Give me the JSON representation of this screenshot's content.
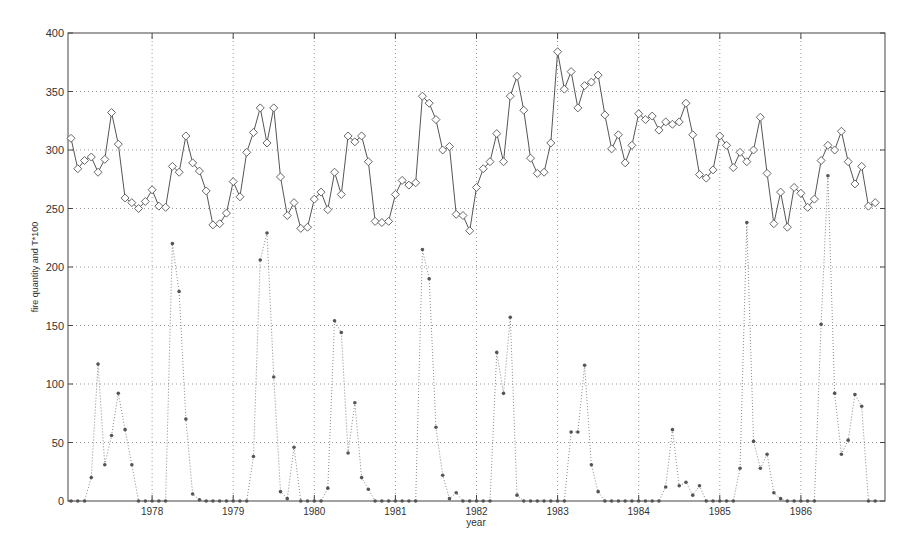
{
  "chart_data": {
    "type": "line",
    "title": "",
    "xlabel": "year",
    "ylabel": "fire quantity and T*100",
    "ylim": [
      0,
      400
    ],
    "yticks": [
      0,
      50,
      100,
      150,
      200,
      250,
      300,
      350,
      400
    ],
    "xticks": [
      "1978",
      "1979",
      "1980",
      "1981",
      "1982",
      "1983",
      "1984",
      "1985",
      "1986"
    ],
    "xlim": [
      1977.0,
      1987.0
    ],
    "grid": true,
    "legend": null,
    "x_start": 1977.0,
    "x_step": 0.08333,
    "series": [
      {
        "name": "T*100",
        "style": "solid line with diamond markers",
        "color": "#555555",
        "values": [
          310,
          284,
          291,
          294,
          281,
          292,
          332,
          305,
          259,
          255,
          250,
          256,
          266,
          252,
          251,
          286,
          281,
          312,
          289,
          282,
          265,
          236,
          237,
          246,
          273,
          260,
          298,
          315,
          336,
          306,
          336,
          277,
          244,
          255,
          233,
          234,
          258,
          264,
          249,
          281,
          262,
          312,
          307,
          312,
          290,
          239,
          238,
          239,
          262,
          274,
          270,
          272,
          346,
          340,
          326,
          300,
          303,
          245,
          244,
          231,
          268,
          284,
          290,
          314,
          290,
          346,
          363,
          334,
          293,
          280,
          281,
          306,
          384,
          352,
          367,
          336,
          355,
          358,
          364,
          330,
          301,
          313,
          289,
          304,
          331,
          326,
          329,
          317,
          324,
          322,
          324,
          340,
          313,
          279,
          276,
          283,
          312,
          304,
          285,
          298,
          290,
          300,
          328,
          280,
          237,
          264,
          234,
          268,
          263,
          251,
          258,
          291,
          304,
          300,
          316,
          290,
          271,
          286,
          252,
          255
        ]
      },
      {
        "name": "fire quantity",
        "style": "dotted line with dot markers",
        "color": "#555555",
        "values": [
          0,
          0,
          0,
          20,
          117,
          31,
          56,
          92,
          61,
          31,
          0,
          0,
          0,
          0,
          0,
          220,
          179,
          70,
          6,
          1,
          0,
          0,
          0,
          0,
          0,
          0,
          0,
          38,
          206,
          229,
          106,
          8,
          2,
          46,
          0,
          0,
          0,
          0,
          11,
          154,
          144,
          41,
          84,
          20,
          10,
          0,
          0,
          0,
          0,
          0,
          0,
          0,
          215,
          190,
          63,
          22,
          2,
          7,
          0,
          0,
          0,
          0,
          0,
          127,
          92,
          157,
          5,
          0,
          0,
          0,
          0,
          0,
          0,
          0,
          59,
          59,
          116,
          31,
          8,
          0,
          0,
          0,
          0,
          0,
          0,
          0,
          0,
          0,
          12,
          61,
          13,
          16,
          5,
          13,
          0,
          0,
          0,
          0,
          0,
          28,
          238,
          51,
          28,
          40,
          7,
          2,
          0,
          0,
          0,
          0,
          0,
          151,
          278,
          92,
          40,
          52,
          91,
          81,
          0,
          0
        ]
      }
    ]
  }
}
